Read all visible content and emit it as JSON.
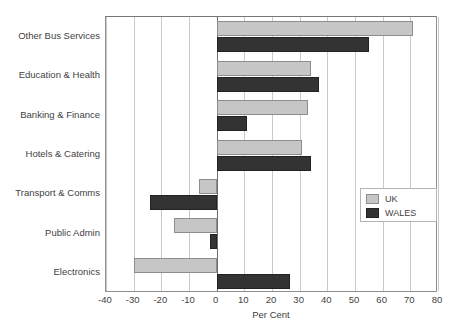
{
  "chart_data": {
    "type": "bar",
    "orientation": "horizontal",
    "title": "",
    "xlabel": "Per Cent",
    "ylabel": "",
    "xlim": [
      -40,
      80
    ],
    "xticks": [
      -40,
      -30,
      -20,
      -10,
      0,
      10,
      20,
      30,
      40,
      50,
      60,
      70,
      80
    ],
    "xtick_labels": [
      "-40",
      "-30",
      "-20",
      "-10",
      "0",
      "10",
      "20",
      "30",
      "40",
      "50",
      "60",
      "70",
      "80"
    ],
    "grid": true,
    "grid_axis": "x",
    "legend_position": "center right",
    "categories": [
      "Other Bus Services",
      "Education & Health",
      "Banking & Finance",
      "Hotels & Catering",
      "Transport & Comms",
      "Public Admin",
      "Electronics"
    ],
    "series": [
      {
        "name": "UK",
        "color": "#c6c6c6",
        "values": [
          71,
          34,
          33,
          31,
          -6.5,
          -15.5,
          -30
        ]
      },
      {
        "name": "WALES",
        "color": "#333333",
        "values": [
          55,
          37,
          11,
          34,
          -24,
          -2.5,
          26.5
        ]
      }
    ]
  },
  "legend": {
    "entries": [
      {
        "label": "UK",
        "swatch": "uk"
      },
      {
        "label": "WALES",
        "swatch": "wales"
      }
    ]
  },
  "axis": {
    "x_title": "Per Cent"
  }
}
